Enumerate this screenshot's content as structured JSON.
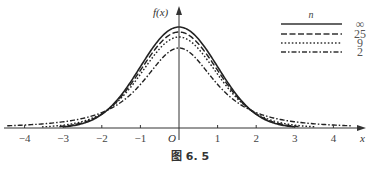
{
  "chart_data": {
    "type": "line",
    "title": "",
    "caption": "图 6. 5",
    "xlabel": "x",
    "ylabel": "f(x)",
    "origin_label": "O",
    "xlim": [
      -4.6,
      4.8
    ],
    "ylim": [
      0,
      0.42
    ],
    "xticks": [
      -4,
      -3,
      -2,
      -1,
      1,
      2,
      3,
      4
    ],
    "xtick_labels": [
      "−4",
      "−3",
      "−2",
      "−1",
      "1",
      "2",
      "3",
      "4"
    ],
    "grid": false,
    "legend": {
      "title": "n",
      "placement": "top-right"
    },
    "series": [
      {
        "name": "∞",
        "df": null,
        "style": "solid",
        "x_range": [
          -3.0,
          3.0
        ],
        "peak": 0.399
      },
      {
        "name": "25",
        "df": 25,
        "style": "dashed",
        "x_range": [
          -3.1,
          3.1
        ],
        "peak": 0.396
      },
      {
        "name": "9",
        "df": 9,
        "style": "dotted",
        "x_range": [
          -3.55,
          3.55
        ],
        "peak": 0.388
      },
      {
        "name": "2",
        "df": 2,
        "style": "dashdot",
        "x_range": [
          -4.45,
          4.45
        ],
        "peak": 0.354
      }
    ]
  }
}
